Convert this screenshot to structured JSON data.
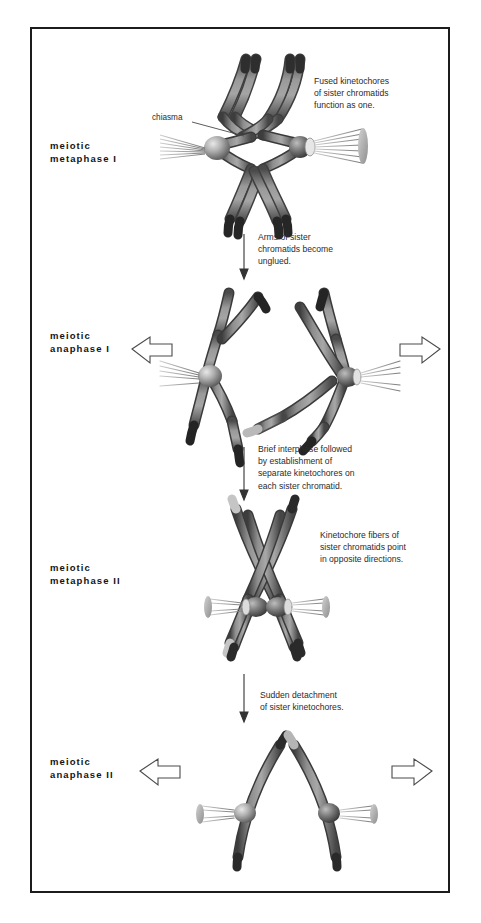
{
  "figure": {
    "border_color": "#1c1c1c",
    "background_color": "#ffffff",
    "chromosome_color_dark": "#3a3a3a",
    "chromosome_color_mid": "#7d7d7d",
    "chromosome_color_light": "#c9c9c9",
    "fiber_color": "#8c8c8c",
    "text_color": "#2b2b2b"
  },
  "stages": [
    {
      "id": "meiotic-metaphase-1",
      "line1": "meiotic",
      "line2": "metaphase I",
      "label": "meiotic\nmetaphase I"
    },
    {
      "id": "meiotic-anaphase-1",
      "line1": "meiotic",
      "line2": "anaphase I",
      "label": "meiotic\nanaphase I"
    },
    {
      "id": "meiotic-metaphase-2",
      "line1": "meiotic",
      "line2": "metaphase II",
      "label": "meiotic\nmetaphase II"
    },
    {
      "id": "meiotic-anaphase-2",
      "line1": "meiotic",
      "line2": "anaphase II",
      "label": "meiotic\nanaphase II"
    }
  ],
  "callouts": {
    "chiasma": "chiasma",
    "fused_kinetochores": "Fused kinetochores\nof sister chromatids\nfunction as one.",
    "kinetochore_fibers": "Kinetochore fibers of\nsister chromatids point\nin opposite directions."
  },
  "transitions": [
    {
      "id": "transition-metaphase1-to-anaphase1",
      "text": "Arms of sister\nchromatids become\nunglued."
    },
    {
      "id": "transition-anaphase1-to-metaphase2",
      "text": "Brief interphase followed\nby establishment of\nseparate kinetochores on\neach sister chromatid."
    },
    {
      "id": "transition-metaphase2-to-anaphase2",
      "text": "Sudden detachment\nof sister kinetochores."
    }
  ],
  "icons": {
    "down_arrow": "down-arrow-icon",
    "left_pull_arrow": "left-pull-arrow-icon",
    "right_pull_arrow": "right-pull-arrow-icon",
    "leader_line": "leader-line-icon"
  }
}
